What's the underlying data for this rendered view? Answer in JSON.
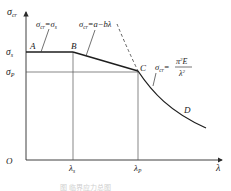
{
  "diagram": {
    "axes": {
      "y_label": "σcr",
      "x_label": "λ",
      "origin": "O"
    },
    "y_ticks": [
      {
        "label": "σs",
        "sub": "s",
        "main": "σ"
      },
      {
        "label": "σP",
        "sub": "P",
        "main": "σ"
      }
    ],
    "x_ticks": [
      {
        "label": "λs",
        "main": "λ",
        "sub": "s"
      },
      {
        "label": "λP",
        "main": "λ",
        "sub": "P"
      }
    ],
    "points": {
      "A": "A",
      "B": "B",
      "C": "C",
      "D": "D"
    },
    "formulas": {
      "yield": {
        "lhs": "σcr",
        "rhs": "=σs",
        "text": "σcr=σs"
      },
      "linear": {
        "lhs": "σcr",
        "rhs": "=a−bλ",
        "text": "σcr=a−bλ"
      },
      "euler": {
        "lhs": "σcr",
        "eq": "=",
        "numerator": "π²E",
        "denominator": "λ²",
        "text": "σcr=π²E/λ²"
      }
    },
    "caption": "图 临界应力总图"
  },
  "colors": {
    "line": "#2a2a2a",
    "grid": "#555555",
    "curve": "#1e1e1e"
  }
}
